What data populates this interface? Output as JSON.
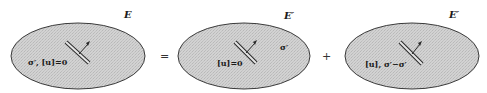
{
  "diagram": {
    "type": "superposition-decomposition",
    "operators": {
      "equals": "=",
      "plus": "+"
    },
    "panels": [
      {
        "id": "total",
        "domain_label": "E",
        "labels": [
          "σ′,  [u]=0"
        ]
      },
      {
        "id": "part1",
        "domain_label": "E′",
        "labels": [
          "[u]=0",
          "σ′"
        ]
      },
      {
        "id": "part2",
        "domain_label": "E′",
        "labels": [
          "[u], σ′−σ′"
        ]
      }
    ],
    "colors": {
      "fill": "#cfcfcf",
      "stroke": "#3a3a3a",
      "text": "#1a1a1a"
    }
  }
}
